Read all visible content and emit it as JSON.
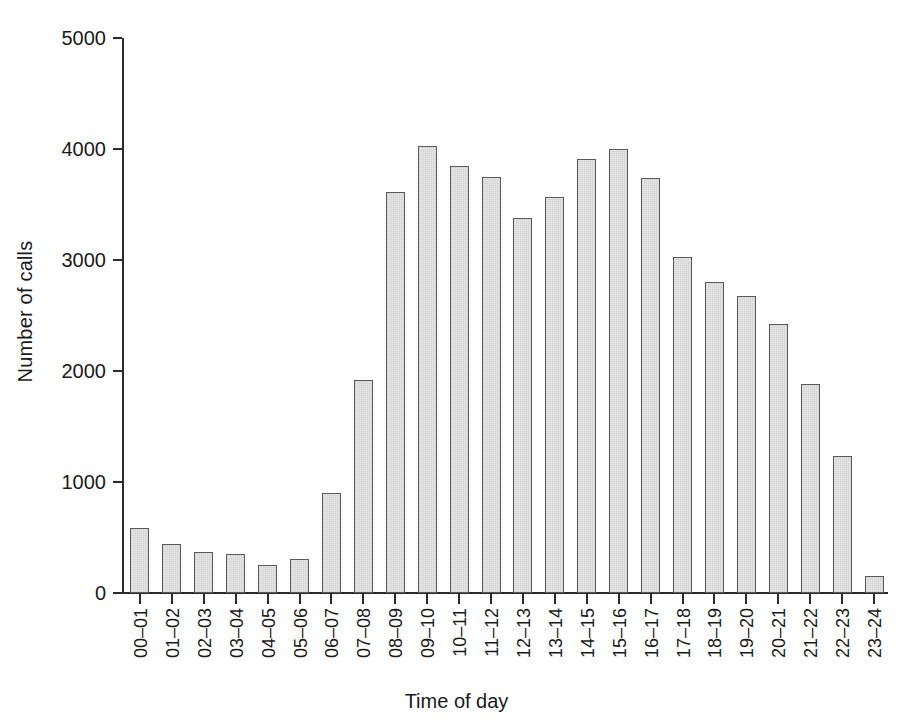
{
  "chart_data": {
    "type": "bar",
    "title": "",
    "xlabel": "Time of day",
    "ylabel": "Number of calls",
    "categories": [
      "00–01",
      "01–02",
      "02–03",
      "03–04",
      "04–05",
      "05–06",
      "06–07",
      "07–08",
      "08–09",
      "09–10",
      "10–11",
      "11–12",
      "12–13",
      "13–14",
      "14–15",
      "15–16",
      "16–17",
      "17–18",
      "18–19",
      "19–20",
      "20–21",
      "21–22",
      "22–23",
      "23–24"
    ],
    "values": [
      590,
      440,
      370,
      350,
      255,
      310,
      900,
      1920,
      3610,
      4030,
      3850,
      3750,
      3380,
      3570,
      3910,
      4000,
      3740,
      3030,
      2800,
      2680,
      2420,
      1880,
      1230,
      150
    ],
    "ylim": [
      0,
      5000
    ],
    "y_ticks": [
      0,
      1000,
      2000,
      3000,
      4000,
      5000
    ],
    "y_tick_labels": [
      "0",
      "1000",
      "2000",
      "3000",
      "4000",
      "5000"
    ],
    "grid": false,
    "legend": false,
    "bar_fill_color": "#e7e7e7",
    "bar_edge_color": "#5a5a5a",
    "axis_color": "#2b2b2b"
  }
}
